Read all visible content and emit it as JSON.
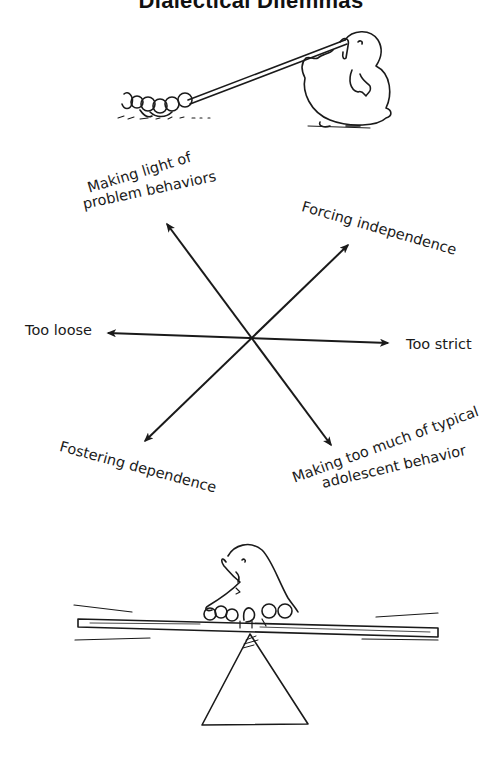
{
  "title": "Dialectical Dilemmas",
  "diagram": {
    "center": [
      252,
      338
    ],
    "axes": [
      {
        "id": "horizontal",
        "left_label": "Too loose",
        "right_label": "Too strict"
      },
      {
        "id": "diagonal-1",
        "upper_left_label": "Making light of problem behaviors",
        "lower_right_label": "Making too much of typical adolescent behavior"
      },
      {
        "id": "diagonal-2",
        "upper_right_label": "Forcing independence",
        "lower_left_label": "Fostering dependence"
      }
    ]
  },
  "labels": {
    "making_light_line1": "Making light of",
    "making_light_line2": "problem behaviors",
    "forcing_independence": "Forcing independence",
    "too_loose": "Too loose",
    "too_strict": "Too strict",
    "fostering_dependence": "Fostering dependence",
    "making_too_much_line1": "Making too much of typical",
    "making_too_much_line2": "adolescent behavior"
  },
  "illustrations": {
    "top": "parent-bird-pulling-chicks-on-rope",
    "bottom": "parent-bird-and-chicks-balancing-on-seesaw"
  },
  "colors": {
    "ink": "#1a1a1a",
    "background": "#ffffff"
  }
}
